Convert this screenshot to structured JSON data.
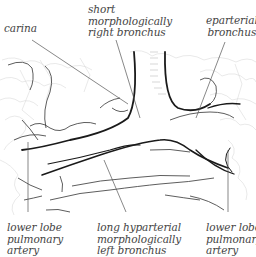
{
  "diagram": {
    "type": "anatomical line drawing",
    "colors": {
      "background": "#ffffff",
      "outline": "#1a1a1a",
      "leader": "#555555",
      "texture": "#c8c8c8",
      "label": "#444444"
    },
    "labels": {
      "carina": {
        "lines": [
          "carina"
        ]
      },
      "short_right": {
        "lines": [
          "short",
          "morphologically",
          "right bronchus"
        ]
      },
      "eparterial": {
        "lines": [
          "eparterial",
          "bronchus"
        ]
      },
      "lower_left_artery": {
        "lines": [
          "lower lobe",
          "pulmonary",
          "artery"
        ]
      },
      "long_left": {
        "lines": [
          "long hyparterial",
          "morphologically",
          "left bronchus"
        ]
      },
      "lower_right_artery": {
        "lines": [
          "lower lobe",
          "pulmonary",
          "artery"
        ]
      }
    }
  }
}
